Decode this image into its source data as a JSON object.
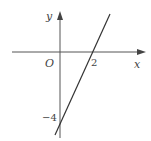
{
  "diagram": {
    "type": "coordinate-graph",
    "axes": {
      "x_label": "x",
      "y_label": "y",
      "origin_label": "O"
    },
    "annotations": {
      "x_intercept_label": "2",
      "y_intercept_label": "−4"
    },
    "line": {
      "equation": "y = 2x - 4",
      "x_intercept": 2,
      "y_intercept": -4,
      "color": "#333333"
    },
    "colors": {
      "axis": "#555555",
      "text": "#444444",
      "background": "#ffffff"
    }
  }
}
